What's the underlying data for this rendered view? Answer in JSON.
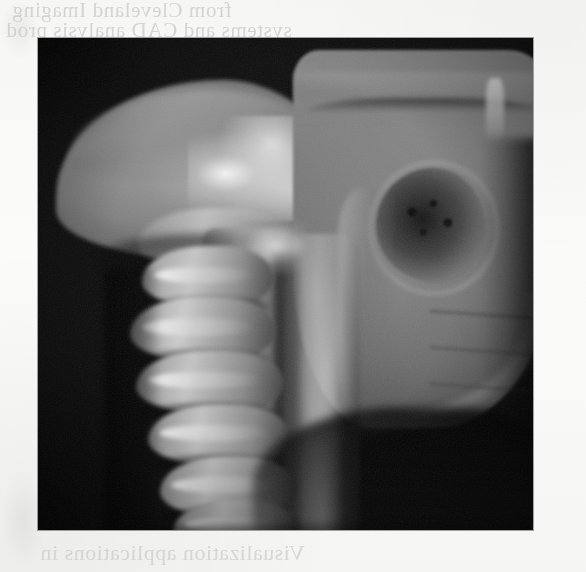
{
  "page": {
    "background_color": "#f7f7f5",
    "kind": "scanned-book-page"
  },
  "bleed_text": {
    "note": "faint mirror-reversed text showing through from the reverse side of the page",
    "top_line_1": "from Cleveland   Imaging",
    "top_line_2": "systems and CAD analysis prod",
    "bottom_line_1": "Visualization applications in"
  },
  "image_plate": {
    "name": "3D volume-rendered grayscale CT of skull base and cervical spine",
    "palette": {
      "background": "#0c0c0c",
      "bone_mid": "#8a8a8a",
      "bone_bright": "#e6e6e6",
      "bone_dark": "#3a3a3a"
    },
    "geometry": {
      "left": 38,
      "top": 38,
      "width": 495,
      "height": 492
    },
    "anatomy_labels": [
      "occipital bone",
      "mastoid process",
      "skull base",
      "orbit / sphenoid",
      "zygomatic arch",
      "mandibular ramus",
      "maxilla",
      "cervical vertebra C2 (axis/dens)",
      "cervical vertebra C3",
      "cervical vertebra C4",
      "cervical vertebra C5",
      "cervical vertebra C6",
      "cervical vertebra C7",
      "spinous processes",
      "posterior element column",
      "spinal canal"
    ]
  }
}
